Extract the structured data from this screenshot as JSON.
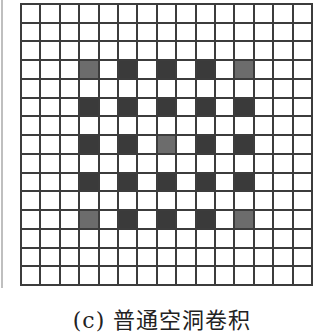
{
  "figure": {
    "caption": "(c) 普通空洞卷积",
    "grid": {
      "rows": 15,
      "cols": 15,
      "line_color": "#3c3c3c",
      "empty_color": "#ffffff",
      "dark_color": "#3a3a3a",
      "mid_color": "#6c6c6c",
      "kernel_rows": [
        3,
        5,
        7,
        9,
        11
      ],
      "kernel_cols": [
        3,
        5,
        7,
        9,
        11
      ],
      "mid_cells": [
        [
          3,
          3
        ],
        [
          3,
          11
        ],
        [
          7,
          7
        ],
        [
          11,
          3
        ],
        [
          11,
          11
        ]
      ]
    }
  }
}
